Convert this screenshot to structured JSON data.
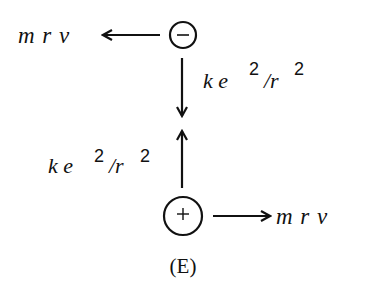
{
  "diagram": {
    "caption": "(E)",
    "top_particle": {
      "charge_symbol": "−",
      "charge": "negative",
      "momentum_label": "m r v",
      "momentum_direction": "left",
      "force_label": {
        "base": "k e",
        "exp1": "2",
        "slash_r": "/r",
        "exp2": "2"
      },
      "force_direction": "down"
    },
    "bottom_particle": {
      "charge_symbol": "+",
      "charge": "positive",
      "momentum_label": "m r v",
      "momentum_direction": "right",
      "force_label": {
        "base": "k e",
        "exp1": "2",
        "slash_r": "/r",
        "exp2": "2"
      },
      "force_direction": "up"
    },
    "colors": {
      "stroke": "#111111",
      "background": "#ffffff"
    }
  }
}
